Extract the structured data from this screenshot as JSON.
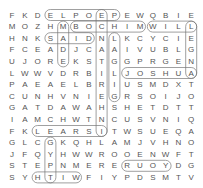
{
  "puzzle": {
    "type": "word-search",
    "rows": 15,
    "cols": 15,
    "grid": [
      "FKDELPOEPEWQBIE",
      "MOZHMBOCHIMWILL",
      "HNKSAIDNLKCYCIE",
      "FCEADJCAAIVUBLG",
      "UJOREKSTGGPRGEN",
      "LWWVDRBILJOSHUA",
      "PAEAELBRIUSMDXT",
      "CUNHVNIEGRSOIJO",
      "GATDAWAHSHETDTT",
      "IAMCHWTNCUSVNIQ",
      "FKLEARSITWSUEQA",
      "GLCGKQHLAMJVHNO",
      "JFQYHWWROOENWFT",
      "STEPNMERERUOYDG",
      "SYHTIWFIYPDSMTV"
    ],
    "found_words": [
      {
        "word": "PEOPLE",
        "start": [
          0,
          3
        ],
        "end": [
          0,
          8
        ]
      },
      {
        "word": "BOCHIM",
        "start": [
          1,
          5
        ],
        "end": [
          1,
          10
        ]
      },
      {
        "word": "WILL",
        "start": [
          1,
          11
        ],
        "end": [
          1,
          14
        ]
      },
      {
        "word": "SAID",
        "start": [
          2,
          3
        ],
        "end": [
          2,
          6
        ]
      },
      {
        "word": "JOSHUA",
        "start": [
          5,
          9
        ],
        "end": [
          5,
          14
        ]
      },
      {
        "word": "ISRAEL",
        "start": [
          10,
          2
        ],
        "end": [
          10,
          7
        ]
      },
      {
        "word": "YOUR",
        "start": [
          13,
          9
        ],
        "end": [
          13,
          12
        ]
      },
      {
        "word": "WITH",
        "start": [
          14,
          2
        ],
        "end": [
          14,
          5
        ]
      },
      {
        "word": "ANGEL",
        "start": [
          1,
          14
        ],
        "end": [
          5,
          14
        ]
      },
      {
        "word": "INHERITANCE",
        "start": [
          0,
          7
        ],
        "end": [
          10,
          7
        ]
      },
      {
        "word": "GILGAL",
        "start": [
          2,
          8
        ],
        "end": [
          7,
          8
        ]
      },
      {
        "word": "MADE",
        "start": [
          1,
          4
        ],
        "end": [
          4,
          4
        ]
      },
      {
        "word": "GIFT",
        "start": [
          11,
          3
        ],
        "end": [
          14,
          3
        ]
      }
    ],
    "colors": {
      "letter": "#555555",
      "outline": "#777777"
    }
  }
}
